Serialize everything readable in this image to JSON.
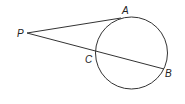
{
  "diagram": {
    "type": "geometry",
    "colors": {
      "stroke": "#333333",
      "label": "#222222",
      "background": "#ffffff"
    },
    "circle": {
      "cx": 131.5,
      "cy": 53,
      "r": 36
    },
    "points": {
      "P": {
        "label": "P",
        "x": 27,
        "y": 33
      },
      "A": {
        "label": "A",
        "x": 121,
        "y": 18
      },
      "C": {
        "label": "C",
        "x": 96,
        "y": 52
      },
      "B": {
        "label": "B",
        "x": 164,
        "y": 69
      }
    },
    "segments": [
      {
        "name": "tangent-PA",
        "from": "P",
        "to": "A"
      },
      {
        "name": "secant-PB",
        "from": "P",
        "to": "B"
      }
    ]
  }
}
